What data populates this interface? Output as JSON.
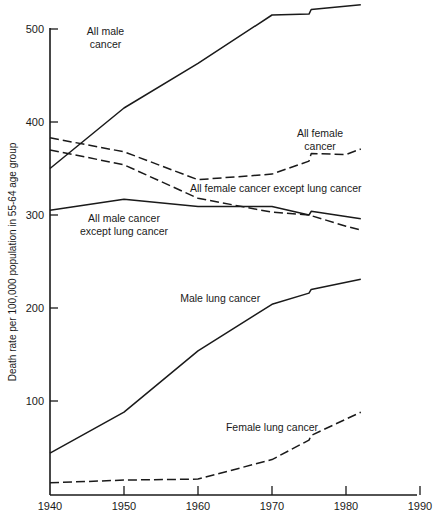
{
  "chart_data": {
    "type": "line",
    "title": "",
    "xlabel": "",
    "ylabel": "Death rate per 100,000 population in 55-64 age group",
    "xlim": [
      1940,
      1990
    ],
    "ylim": [
      0,
      520
    ],
    "x_ticks": [
      1940,
      1950,
      1960,
      1970,
      1980,
      1990
    ],
    "y_ticks": [
      100,
      200,
      300,
      400,
      500
    ],
    "grid": false,
    "legend": "inline labels",
    "series": [
      {
        "name": "All male cancer",
        "style": "solid",
        "x": [
          1940,
          1950,
          1960,
          1970,
          1975,
          1975.3,
          1982
        ],
        "values": [
          350,
          415,
          463,
          515,
          516,
          521,
          526
        ]
      },
      {
        "name": "All female cancer",
        "style": "dashed",
        "x": [
          1940,
          1950,
          1960,
          1970,
          1975,
          1975.3,
          1980,
          1982
        ],
        "values": [
          383,
          368,
          338,
          344,
          358,
          366,
          365,
          371
        ]
      },
      {
        "name": "All female cancer except lung cancer",
        "style": "dashed",
        "x": [
          1940,
          1950,
          1960,
          1970,
          1975,
          1980,
          1982
        ],
        "values": [
          370,
          354,
          318,
          303,
          300,
          288,
          284
        ]
      },
      {
        "name": "All male cancer except lung cancer",
        "style": "solid",
        "x": [
          1940,
          1950,
          1960,
          1970,
          1975,
          1975.3,
          1982
        ],
        "values": [
          305,
          317,
          309,
          309,
          300,
          304,
          296
        ]
      },
      {
        "name": "Male lung cancer",
        "style": "solid",
        "x": [
          1940,
          1950,
          1960,
          1970,
          1975,
          1975.3,
          1982
        ],
        "values": [
          44,
          88,
          154,
          204,
          216,
          220,
          231
        ]
      },
      {
        "name": "Female lung cancer",
        "style": "dashed",
        "x": [
          1940,
          1950,
          1960,
          1970,
          1975,
          1975.3,
          1982
        ],
        "values": [
          12,
          15,
          16,
          37,
          58,
          63,
          88
        ]
      }
    ],
    "annotations": [
      {
        "text": [
          "All male",
          "cancer"
        ],
        "x": 1947.5,
        "y": 494
      },
      {
        "text": [
          "All female",
          "cancer"
        ],
        "x": 1976.5,
        "y": 384
      },
      {
        "text": [
          "All female cancer except lung cancer"
        ],
        "x": 1970.5,
        "y": 325
      },
      {
        "text": [
          "All male cancer",
          "except lung cancer"
        ],
        "x": 1950,
        "y": 292
      },
      {
        "text": [
          "Male lung cancer"
        ],
        "x": 1963,
        "y": 206
      },
      {
        "text": [
          "Female lung cancer"
        ],
        "x": 1970,
        "y": 68
      }
    ]
  }
}
